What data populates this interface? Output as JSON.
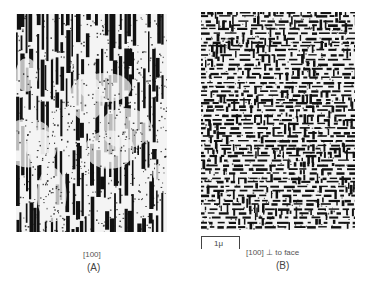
{
  "figure": {
    "panels": [
      {
        "id": "A",
        "caption": "(A)",
        "orientation_label": "[100]",
        "texture": "vertical-rods",
        "seed": 7,
        "width": 151,
        "height": 218
      },
      {
        "id": "B",
        "caption": "(B)",
        "orientation_label": "[100]  ⊥   to face",
        "texture": "cross-hatch",
        "seed": 13,
        "width": 154,
        "height": 218
      }
    ],
    "scale_bar": {
      "label": "1μ"
    }
  },
  "colors": {
    "ink": "#111111",
    "paper": "#f4f4f4",
    "text": "#444444"
  }
}
